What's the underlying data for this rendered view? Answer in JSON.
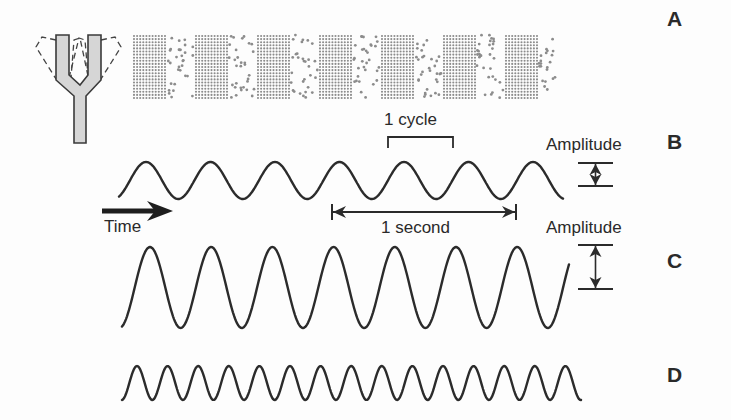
{
  "colors": {
    "stroke": "#2b2b2b",
    "dot": "#8c8c8c",
    "fork_fill": "#d6d6d6",
    "fork_stroke": "#3a3a3a",
    "background": "#fdfdfd"
  },
  "panels": {
    "A": {
      "letter": "A",
      "description": "Tuning fork producing compressions and rarefactions of air molecules"
    },
    "B": {
      "letter": "B",
      "amplitude_label": "Amplitude",
      "cycle_label": "1 cycle",
      "second_label": "1 second",
      "time_label": "Time"
    },
    "C": {
      "letter": "C",
      "amplitude_label": "Amplitude"
    },
    "D": {
      "letter": "D"
    }
  },
  "waves": {
    "B": {
      "x_start": 119,
      "x_end": 563,
      "y_center": 180.5,
      "half_amplitude": 18.5,
      "period": 64.5,
      "first_peak_x": 146,
      "cycles_per_second": 3
    },
    "C": {
      "x_start": 122,
      "x_end": 569,
      "y_center": 287.5,
      "half_amplitude": 40.5,
      "period": 61.2,
      "first_peak_x": 150
    },
    "D": {
      "x_start": 122,
      "x_end": 581,
      "y_center": 383,
      "half_amplitude": 17,
      "period": 30.6,
      "first_peak_x": 137
    }
  },
  "sound_band": {
    "x_start": 133,
    "x_end": 557,
    "y_top": 35,
    "y_bottom": 98,
    "band_period": 62,
    "compression_width": 33
  },
  "annotations": {
    "cycle_bracket": {
      "x1": 388,
      "x2": 453,
      "y_top": 137,
      "y_bottom": 148
    },
    "second_arrow": {
      "x1": 332,
      "x2": 516,
      "y": 212
    },
    "time_arrow": {
      "x1": 102,
      "x2": 173,
      "y": 211
    },
    "amp_B": {
      "x1": 578,
      "x2": 613,
      "y_top": 163,
      "y_bottom": 186
    },
    "amp_C": {
      "x1": 578,
      "x2": 613,
      "y_top": 245,
      "y_bottom": 289
    }
  }
}
